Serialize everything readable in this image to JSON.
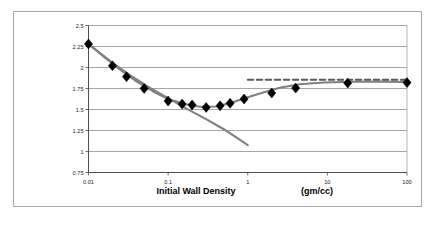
{
  "figure": {
    "background_color": "#ffffff",
    "frame_color": "#a8a8a8"
  },
  "chart_data": {
    "type": "scatter",
    "title": "",
    "subtitle": "",
    "xlabel": "Initial Wall Density",
    "xunits": "(gm/cc)",
    "ylabel": "",
    "xscale": "log",
    "yscale": "linear",
    "xlim": [
      0.01,
      100
    ],
    "ylim": [
      0.75,
      2.5
    ],
    "grid": "horizontal",
    "legend": "none",
    "xticks": [
      "0.01",
      "0.1",
      "1",
      "10",
      "100"
    ],
    "xtick_values": [
      0.01,
      0.1,
      1,
      10,
      100
    ],
    "yticks": [
      "0.75",
      "1",
      "1.25",
      "1.5",
      "1.75",
      "2",
      "2.25",
      "2.5"
    ],
    "ytick_values": [
      0.75,
      1,
      1.25,
      1.5,
      1.75,
      2,
      2.25,
      2.5
    ],
    "marker_color": "#000000",
    "marker_shape": "diamond",
    "series": [
      {
        "name": "data-points",
        "type": "scatter",
        "marker": "diamond",
        "color": "#000000",
        "points": [
          {
            "x": 0.01,
            "y": 2.28
          },
          {
            "x": 0.02,
            "y": 2.02
          },
          {
            "x": 0.03,
            "y": 1.89
          },
          {
            "x": 0.05,
            "y": 1.75
          },
          {
            "x": 0.1,
            "y": 1.6
          },
          {
            "x": 0.15,
            "y": 1.565
          },
          {
            "x": 0.2,
            "y": 1.555
          },
          {
            "x": 0.3,
            "y": 1.525
          },
          {
            "x": 0.45,
            "y": 1.545
          },
          {
            "x": 0.6,
            "y": 1.575
          },
          {
            "x": 0.9,
            "y": 1.625
          },
          {
            "x": 2.0,
            "y": 1.695
          },
          {
            "x": 4.0,
            "y": 1.755
          },
          {
            "x": 18.0,
            "y": 1.815
          },
          {
            "x": 100.0,
            "y": 1.82
          }
        ]
      },
      {
        "name": "fit-curve-upper",
        "type": "line",
        "style": "solid",
        "color": "#808080",
        "points": [
          {
            "x": 0.01,
            "y": 2.28
          },
          {
            "x": 0.016,
            "y": 2.12
          },
          {
            "x": 0.025,
            "y": 1.975
          },
          {
            "x": 0.04,
            "y": 1.835
          },
          {
            "x": 0.065,
            "y": 1.715
          },
          {
            "x": 0.1,
            "y": 1.625
          },
          {
            "x": 0.16,
            "y": 1.565
          },
          {
            "x": 0.25,
            "y": 1.532
          },
          {
            "x": 0.4,
            "y": 1.535
          },
          {
            "x": 0.65,
            "y": 1.585
          },
          {
            "x": 1.0,
            "y": 1.645
          },
          {
            "x": 1.6,
            "y": 1.705
          },
          {
            "x": 2.6,
            "y": 1.762
          },
          {
            "x": 4.5,
            "y": 1.8
          },
          {
            "x": 9.0,
            "y": 1.822
          },
          {
            "x": 20.0,
            "y": 1.83
          },
          {
            "x": 50.0,
            "y": 1.832
          },
          {
            "x": 100.0,
            "y": 1.828
          }
        ]
      },
      {
        "name": "fit-curve-descending",
        "type": "line",
        "style": "solid",
        "color": "#808080",
        "points": [
          {
            "x": 0.01,
            "y": 2.28
          },
          {
            "x": 0.02,
            "y": 2.055
          },
          {
            "x": 0.035,
            "y": 1.895
          },
          {
            "x": 0.06,
            "y": 1.755
          },
          {
            "x": 0.1,
            "y": 1.635
          },
          {
            "x": 0.17,
            "y": 1.51
          },
          {
            "x": 0.3,
            "y": 1.385
          },
          {
            "x": 0.5,
            "y": 1.265
          },
          {
            "x": 0.75,
            "y": 1.155
          },
          {
            "x": 1.0,
            "y": 1.075
          }
        ]
      },
      {
        "name": "asymptote-dashed",
        "type": "line",
        "style": "dashed",
        "color": "#5a5a5a",
        "points": [
          {
            "x": 1.0,
            "y": 1.855
          },
          {
            "x": 100.0,
            "y": 1.855
          }
        ]
      }
    ]
  }
}
